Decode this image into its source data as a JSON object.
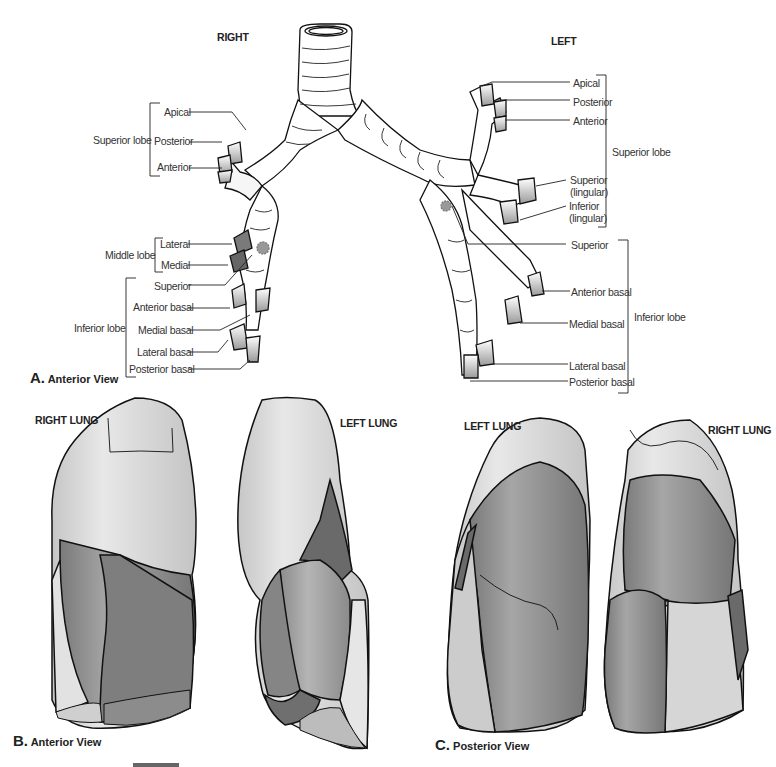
{
  "panel_a": {
    "caption_letter": "A.",
    "caption_text": "Anterior View",
    "side_right": "RIGHT",
    "side_left": "LEFT",
    "right": {
      "superior_lobe": {
        "label": "Superior lobe",
        "segments": [
          "Apical",
          "Posterior",
          "Anterior"
        ]
      },
      "middle_lobe": {
        "label": "Middle lobe",
        "segments": [
          "Lateral",
          "Medial"
        ]
      },
      "inferior_lobe": {
        "label": "Inferior lobe",
        "segments": [
          "Superior",
          "Anterior basal",
          "Medial basal",
          "Lateral basal",
          "Posterior basal"
        ]
      }
    },
    "left": {
      "superior_lobe": {
        "label": "Superior lobe",
        "segments": [
          "Apical",
          "Posterior",
          "Anterior",
          "Superior",
          "(lingular)",
          "Inferior",
          "(lingular)"
        ]
      },
      "inferior_lobe": {
        "label": "Inferior lobe",
        "segments": [
          "Superior",
          "Anterior basal",
          "Medial basal",
          "Lateral basal",
          "Posterior basal"
        ]
      }
    }
  },
  "panel_b": {
    "caption_letter": "B.",
    "caption_text": "Anterior View",
    "right_lung": "RIGHT LUNG",
    "left_lung": "LEFT LUNG"
  },
  "panel_c": {
    "caption_letter": "C.",
    "caption_text": "Posterior View",
    "left_lung": "LEFT LUNG",
    "right_lung": "RIGHT LUNG"
  },
  "colors": {
    "outline": "#111111",
    "light_gray": "#cfcfcf",
    "lighter_gray": "#e4e4e4",
    "mid_gray": "#9a9a9a",
    "dark_gray": "#6e6e6e",
    "darker_gray": "#5a5a5a"
  }
}
